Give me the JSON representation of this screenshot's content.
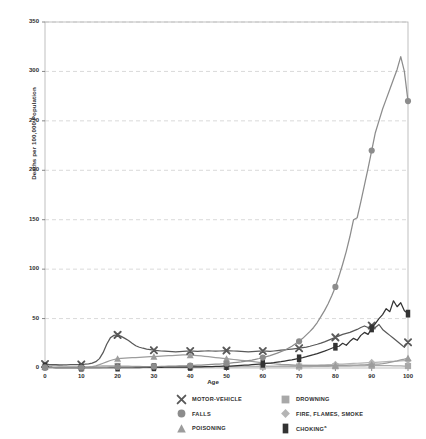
{
  "chart_data": {
    "type": "line",
    "title": "",
    "xlabel": "Age",
    "ylabel": "Deaths per 100,000 Population",
    "xlim": [
      0,
      100
    ],
    "ylim": [
      0,
      350
    ],
    "yticks": [
      0,
      50,
      100,
      150,
      200,
      250,
      300,
      350
    ],
    "xticks": [
      0,
      10,
      20,
      30,
      40,
      50,
      60,
      70,
      80,
      90,
      100
    ],
    "grid": "horizontal-dashed",
    "legend_position": "bottom",
    "x": [
      0,
      1,
      2,
      3,
      4,
      5,
      6,
      7,
      8,
      9,
      10,
      11,
      12,
      13,
      14,
      15,
      16,
      17,
      18,
      19,
      20,
      21,
      22,
      23,
      24,
      25,
      26,
      27,
      28,
      29,
      30,
      31,
      32,
      33,
      34,
      35,
      36,
      37,
      38,
      39,
      40,
      41,
      42,
      43,
      44,
      45,
      46,
      47,
      48,
      49,
      50,
      51,
      52,
      53,
      54,
      55,
      56,
      57,
      58,
      59,
      60,
      61,
      62,
      63,
      64,
      65,
      66,
      67,
      68,
      69,
      70,
      71,
      72,
      73,
      74,
      75,
      76,
      77,
      78,
      79,
      80,
      81,
      82,
      83,
      84,
      85,
      86,
      87,
      88,
      89,
      90,
      91,
      92,
      93,
      94,
      95,
      96,
      97,
      98,
      99,
      100
    ],
    "series": [
      {
        "name": "MOTOR-VEHICLE",
        "marker": "x",
        "color": "#595959",
        "values": [
          4.0,
          3.6,
          3.4,
          3.3,
          3.2,
          3.1,
          3.2,
          3.3,
          3.4,
          3.5,
          3.6,
          3.8,
          4.2,
          5.0,
          6.4,
          9.5,
          15.5,
          24.0,
          30.5,
          33.0,
          33.5,
          32.0,
          30.0,
          27.8,
          25.0,
          22.5,
          21.0,
          20.0,
          19.2,
          18.6,
          18.0,
          17.6,
          17.2,
          17.0,
          16.8,
          16.6,
          16.4,
          16.6,
          16.8,
          17.0,
          17.2,
          17.0,
          16.8,
          17.0,
          17.2,
          17.4,
          17.2,
          17.0,
          17.2,
          17.4,
          17.6,
          17.4,
          17.2,
          17.0,
          16.8,
          16.6,
          16.4,
          16.6,
          16.8,
          17.0,
          17.2,
          17.0,
          16.8,
          17.2,
          17.6,
          18.0,
          18.4,
          18.8,
          19.2,
          19.6,
          20.0,
          20.6,
          21.2,
          22.0,
          23.0,
          24.0,
          25.2,
          26.5,
          28.0,
          29.5,
          31.0,
          32.5,
          34.0,
          35.0,
          36.0,
          37.5,
          39.0,
          41.0,
          42.5,
          41.0,
          43.0,
          41.0,
          44.0,
          39.0,
          36.0,
          33.0,
          30.0,
          27.0,
          24.0,
          21.0,
          26.0
        ]
      },
      {
        "name": "FALLS",
        "marker": "circle",
        "color": "#8c8c8c",
        "values": [
          0.6,
          0.4,
          0.4,
          0.4,
          0.4,
          0.3,
          0.3,
          0.3,
          0.3,
          0.3,
          0.3,
          0.3,
          0.3,
          0.4,
          0.4,
          0.5,
          0.6,
          0.7,
          0.8,
          0.8,
          0.9,
          0.9,
          0.9,
          1.0,
          1.0,
          1.1,
          1.1,
          1.2,
          1.2,
          1.3,
          1.4,
          1.5,
          1.6,
          1.7,
          1.8,
          1.9,
          2.0,
          2.1,
          2.2,
          2.3,
          2.5,
          2.6,
          2.8,
          3.0,
          3.2,
          3.4,
          3.6,
          3.8,
          4.0,
          4.3,
          4.6,
          5.0,
          5.4,
          5.8,
          6.2,
          6.8,
          7.4,
          8.0,
          8.8,
          9.6,
          10.5,
          11.5,
          12.5,
          13.8,
          15.0,
          16.5,
          18.0,
          20.0,
          22.0,
          24.5,
          27.0,
          30.0,
          33.5,
          37.0,
          41.0,
          46.0,
          52.0,
          58.0,
          65.0,
          73.0,
          82.0,
          93.0,
          105.0,
          118.0,
          133.0,
          150.0,
          152.0,
          168.0,
          185.0,
          202.0,
          220.0,
          238.0,
          250.0,
          262.0,
          272.0,
          282.0,
          292.0,
          302.0,
          315.0,
          300.0,
          270.0
        ]
      },
      {
        "name": "POISONING",
        "marker": "triangle",
        "color": "#9c9c9c",
        "values": [
          1.2,
          0.8,
          0.6,
          0.5,
          0.5,
          0.5,
          0.5,
          0.5,
          0.5,
          0.5,
          0.6,
          0.7,
          0.9,
          1.4,
          2.2,
          3.4,
          4.8,
          6.2,
          7.6,
          8.6,
          9.4,
          9.8,
          10.0,
          10.2,
          10.4,
          10.6,
          10.8,
          11.0,
          11.2,
          11.4,
          11.6,
          11.8,
          12.0,
          12.2,
          12.4,
          12.6,
          12.8,
          13.0,
          13.2,
          13.2,
          13.0,
          12.8,
          12.5,
          12.2,
          11.8,
          11.4,
          11.0,
          10.6,
          10.2,
          9.8,
          9.4,
          9.0,
          8.6,
          8.2,
          7.8,
          7.4,
          7.0,
          6.6,
          6.2,
          5.8,
          5.4,
          5.0,
          4.6,
          4.3,
          4.0,
          3.7,
          3.5,
          3.3,
          3.1,
          2.9,
          2.8,
          2.7,
          2.6,
          2.5,
          2.5,
          2.4,
          2.4,
          2.4,
          2.4,
          2.5,
          2.5,
          2.6,
          2.6,
          2.7,
          2.8,
          2.9,
          3.0,
          3.1,
          3.2,
          3.4,
          3.6,
          3.8,
          4.0,
          4.4,
          5.0,
          5.6,
          6.4,
          7.2,
          8.2,
          9.0,
          10.0
        ]
      },
      {
        "name": "DROWNING",
        "marker": "square",
        "color": "#a8a8a8",
        "values": [
          1.0,
          2.6,
          3.2,
          2.8,
          2.3,
          1.9,
          1.6,
          1.4,
          1.3,
          1.2,
          1.1,
          1.1,
          1.2,
          1.4,
          1.6,
          1.9,
          2.1,
          2.2,
          2.2,
          2.2,
          2.1,
          2.0,
          1.9,
          1.8,
          1.7,
          1.6,
          1.6,
          1.5,
          1.5,
          1.4,
          1.4,
          1.3,
          1.3,
          1.3,
          1.3,
          1.3,
          1.2,
          1.2,
          1.2,
          1.2,
          1.2,
          1.2,
          1.2,
          1.2,
          1.2,
          1.3,
          1.3,
          1.3,
          1.3,
          1.3,
          1.4,
          1.4,
          1.4,
          1.4,
          1.4,
          1.4,
          1.4,
          1.4,
          1.4,
          1.4,
          1.4,
          1.4,
          1.4,
          1.4,
          1.4,
          1.4,
          1.4,
          1.4,
          1.5,
          1.5,
          1.5,
          1.5,
          1.5,
          1.5,
          1.6,
          1.6,
          1.6,
          1.7,
          1.7,
          1.8,
          1.8,
          1.9,
          1.9,
          2.0,
          2.0,
          2.1,
          2.1,
          2.2,
          2.2,
          2.3,
          2.3,
          2.3,
          2.3,
          2.3,
          2.3,
          2.3,
          2.2,
          2.2,
          2.1,
          2.0,
          2.0
        ]
      },
      {
        "name": "FIRE, FLAMES, SMOKE",
        "marker": "diamond",
        "color": "#b5b5b5",
        "values": [
          1.4,
          1.8,
          2.0,
          1.9,
          1.7,
          1.5,
          1.3,
          1.2,
          1.1,
          1.0,
          0.9,
          0.9,
          0.8,
          0.8,
          0.8,
          0.8,
          0.8,
          0.8,
          0.8,
          0.8,
          0.8,
          0.8,
          0.8,
          0.8,
          0.8,
          0.8,
          0.8,
          0.8,
          0.8,
          0.9,
          0.9,
          0.9,
          0.9,
          1.0,
          1.0,
          1.0,
          1.0,
          1.1,
          1.1,
          1.1,
          1.1,
          1.2,
          1.2,
          1.2,
          1.2,
          1.3,
          1.3,
          1.3,
          1.4,
          1.4,
          1.4,
          1.5,
          1.5,
          1.5,
          1.6,
          1.6,
          1.6,
          1.7,
          1.7,
          1.8,
          1.8,
          1.9,
          1.9,
          2.0,
          2.0,
          2.1,
          2.2,
          2.2,
          2.3,
          2.4,
          2.5,
          2.6,
          2.7,
          2.8,
          2.9,
          3.0,
          3.1,
          3.2,
          3.4,
          3.5,
          3.6,
          3.8,
          4.0,
          4.2,
          4.4,
          4.6,
          4.8,
          5.0,
          5.2,
          5.4,
          5.6,
          5.8,
          6.0,
          6.2,
          6.4,
          6.6,
          6.8,
          7.0,
          7.2,
          7.4,
          7.6
        ]
      },
      {
        "name": "CHOKING",
        "marker": "bar",
        "color": "#333333",
        "values": [
          1.6,
          0.9,
          0.6,
          0.5,
          0.4,
          0.4,
          0.3,
          0.3,
          0.3,
          0.3,
          0.3,
          0.3,
          0.3,
          0.3,
          0.3,
          0.3,
          0.3,
          0.4,
          0.4,
          0.4,
          0.4,
          0.4,
          0.4,
          0.5,
          0.5,
          0.5,
          0.5,
          0.6,
          0.6,
          0.6,
          0.7,
          0.7,
          0.7,
          0.8,
          0.8,
          0.8,
          0.9,
          0.9,
          1.0,
          1.0,
          1.1,
          1.1,
          1.2,
          1.2,
          1.3,
          1.4,
          1.5,
          1.6,
          1.7,
          1.8,
          1.9,
          2.0,
          2.2,
          2.4,
          2.6,
          2.8,
          3.0,
          3.3,
          3.6,
          3.9,
          4.2,
          4.6,
          5.0,
          5.4,
          5.9,
          6.4,
          7.0,
          7.6,
          8.2,
          9.0,
          9.8,
          10.6,
          11.5,
          12.5,
          13.5,
          14.6,
          15.8,
          17.0,
          18.5,
          20.0,
          21.5,
          22.0,
          25.0,
          23.0,
          27.0,
          30.0,
          28.0,
          33.0,
          36.0,
          34.0,
          40.0,
          45.0,
          50.0,
          54.0,
          60.0,
          57.0,
          68.0,
          62.0,
          66.0,
          58.0,
          55.0
        ]
      }
    ]
  },
  "axis": {
    "y_ticks": [
      "0",
      "50",
      "100",
      "150",
      "200",
      "250",
      "300",
      "350"
    ],
    "x_ticks": [
      "0",
      "10",
      "20",
      "30",
      "40",
      "50",
      "60",
      "70",
      "80",
      "90",
      "100"
    ],
    "y_title": "Deaths per 100,000 Population",
    "x_title": "Age"
  },
  "legend": {
    "items": [
      {
        "label": "MOTOR-VEHICLE",
        "marker": "x",
        "color": "#595959",
        "name": "motor-vehicle"
      },
      {
        "label": "DROWNING",
        "marker": "square",
        "color": "#a8a8a8",
        "name": "drowning"
      },
      {
        "label": "FALLS",
        "marker": "circle",
        "color": "#8c8c8c",
        "name": "falls"
      },
      {
        "label": "FIRE, FLAMES, SMOKE",
        "marker": "diamond",
        "color": "#b5b5b5",
        "name": "fire-flames-smoke"
      },
      {
        "label": "POISONING",
        "marker": "triangle",
        "color": "#9c9c9c",
        "name": "poisoning"
      },
      {
        "label": "CHOKING",
        "marker": "bar",
        "color": "#333333",
        "name": "choking",
        "footnote": "a"
      }
    ]
  }
}
